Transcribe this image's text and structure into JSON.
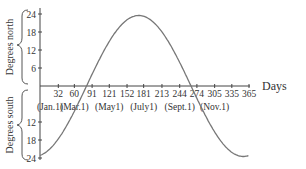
{
  "chart_data": {
    "type": "line",
    "title": "",
    "xlabel": "Days",
    "ylabel_north": "Degrees north",
    "ylabel_south": "Degrees south",
    "x_ticks": [
      32,
      60,
      91,
      121,
      152,
      181,
      213,
      244,
      274,
      305,
      335,
      365
    ],
    "month_labels": [
      {
        "day": 0,
        "label": "(Jan.1)"
      },
      {
        "day": 60,
        "label": "(Mar.1)"
      },
      {
        "day": 121,
        "label": "(May1)"
      },
      {
        "day": 181,
        "label": "(July1)"
      },
      {
        "day": 244,
        "label": "(Sept.1)"
      },
      {
        "day": 305,
        "label": "(Nov.1)"
      }
    ],
    "y_ticks_north": [
      6,
      12,
      18,
      24
    ],
    "y_ticks_south": [
      12,
      18,
      24
    ],
    "ylim": [
      -24,
      24
    ],
    "xlim": [
      0,
      365
    ],
    "series": [
      {
        "name": "Sun declination",
        "x": [
          0,
          30,
          60,
          80,
          91,
          121,
          152,
          172,
          181,
          213,
          244,
          266,
          274,
          305,
          335,
          355,
          365
        ],
        "values": [
          -23.5,
          -18.5,
          -8.5,
          0,
          4.5,
          15,
          22,
          23.5,
          23,
          18,
          8,
          0,
          -3,
          -14.5,
          -21.5,
          -23.5,
          -23
        ]
      }
    ]
  },
  "labels": {
    "days": "Days",
    "north": "Degrees north",
    "south": "Degrees south"
  }
}
